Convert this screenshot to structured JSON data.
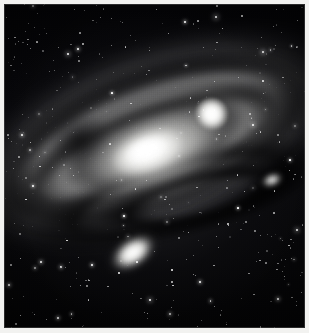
{
  "image": {
    "kind": "astronomical-photograph",
    "medium": "monochrome photographic plate",
    "subject": "Andromeda Galaxy",
    "caption": "",
    "orientation": "landscape galaxy disk inclined across a dense star field",
    "width_px": 309,
    "height_px": 333
  },
  "colors": {
    "mat_border": "#f2f2f0",
    "plate_edge": "#787878",
    "sky_dark": "#050507",
    "sky_mid": "#0a0a0d",
    "halo_gray": "#9e9e9c",
    "arm_gray": "#babab8",
    "dust_dark": "#3e3e42",
    "core_white": "#ffffff",
    "star_white": "#ffffff"
  },
  "objects": [
    {
      "id": "galaxy-disk",
      "label": "Andromeda Galaxy disk",
      "shape": "inclined ellipse",
      "center_pct": [
        48,
        45
      ],
      "tilt_deg": -20,
      "brightness": "bright core fading to faint outer halo"
    },
    {
      "id": "nucleus",
      "label": "Galactic nucleus",
      "shape": "elongated bright ellipse",
      "center_pct": [
        48,
        45
      ],
      "tilt_deg": -20,
      "brightness": "saturated white"
    },
    {
      "id": "dust-lanes",
      "label": "Dust lanes",
      "shape": "dark concentric arcs",
      "count": 4,
      "brightness": "dark silhouettes against the disk"
    },
    {
      "id": "satellite-upper-right",
      "label": "Companion elliptical galaxy (upper right)",
      "shape": "round compact blob",
      "center_pct": [
        69,
        34
      ],
      "brightness": "bright white"
    },
    {
      "id": "satellite-lower-left",
      "label": "Companion elliptical galaxy (lower left)",
      "shape": "tilted oval",
      "center_pct": [
        43,
        77
      ],
      "tilt_deg": -34,
      "brightness": "bright white"
    },
    {
      "id": "star-cloud-knot",
      "label": "Bright star cloud in outer arm",
      "shape": "small oval knot",
      "center_pct": [
        89,
        54
      ],
      "brightness": "bright"
    },
    {
      "id": "star-field",
      "label": "Foreground star field",
      "shape": "scattered point sources",
      "approx_star_count": 430,
      "brightness": "mixed faint to brilliant"
    }
  ],
  "stars_bright": [
    [
      216,
      17,
      2.6
    ],
    [
      68,
      54,
      2.2
    ],
    [
      263,
      52,
      2.4
    ],
    [
      78,
      49,
      1.9
    ],
    [
      253,
      125,
      2.3
    ],
    [
      22,
      135,
      2.0
    ],
    [
      185,
      22,
      1.8
    ],
    [
      297,
      230,
      2.1
    ],
    [
      41,
      262,
      2.0
    ],
    [
      150,
      300,
      2.2
    ],
    [
      9,
      285,
      1.9
    ],
    [
      278,
      299,
      2.0
    ],
    [
      112,
      93,
      1.7
    ],
    [
      33,
      186,
      1.8
    ],
    [
      238,
      208,
      1.7
    ],
    [
      92,
      265,
      1.8
    ],
    [
      200,
      282,
      1.9
    ],
    [
      124,
      216,
      1.6
    ],
    [
      58,
      318,
      1.8
    ],
    [
      290,
      160,
      1.7
    ]
  ]
}
